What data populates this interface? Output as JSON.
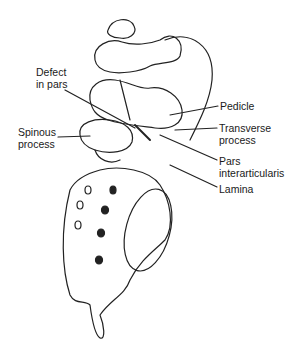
{
  "diagram": {
    "labels": [
      {
        "id": "defect-in-pars",
        "text": "Defect\nin pars",
        "x": 36,
        "y": 72
      },
      {
        "id": "spinous-process",
        "text": "Spinous\nprocess",
        "x": 18,
        "y": 129
      },
      {
        "id": "pedicle",
        "text": "Pedicle",
        "x": 220,
        "y": 101
      },
      {
        "id": "transverse-process",
        "text": "Transverse\nprocess",
        "x": 219,
        "y": 122
      },
      {
        "id": "pars-interarticularis",
        "text": "Pars\ninterarticularis",
        "x": 219,
        "y": 155
      },
      {
        "id": "lamina",
        "text": "Lamina",
        "x": 219,
        "y": 183
      }
    ]
  }
}
